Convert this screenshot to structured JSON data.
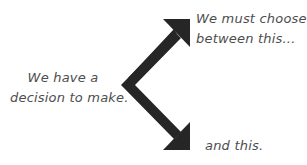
{
  "diagram": {
    "source_text": {
      "line1": "We have a",
      "line2": "decision to make."
    },
    "option_top": {
      "line1": "We must choose",
      "line2": "between this..."
    },
    "option_bottom": {
      "line1": "and this."
    },
    "arrow": {
      "color": "#262626",
      "type": "forked-arrow",
      "branches": [
        "up-right",
        "down-right"
      ]
    },
    "text_color": "#4d4d4d"
  }
}
